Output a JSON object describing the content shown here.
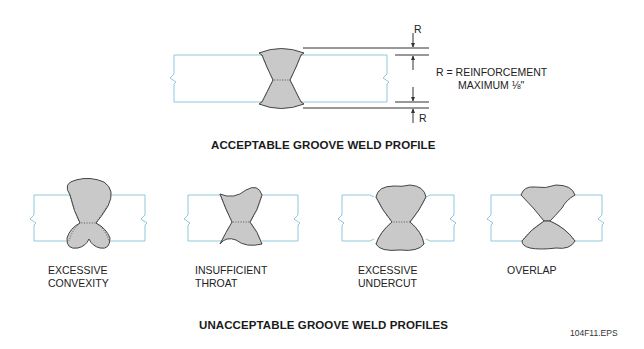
{
  "acceptable": {
    "heading": "ACCEPTABLE GROOVE WELD PROFILE",
    "dimension_symbol_top": "R",
    "dimension_symbol_bottom": "R",
    "note_line1": "R = REINFORCEMENT",
    "note_line2": "MAXIMUM ⅛\""
  },
  "unacceptable": {
    "heading": "UNACCEPTABLE GROOVE WELD PROFILES",
    "profiles": [
      {
        "line1": "EXCESSIVE",
        "line2": "CONVEXITY"
      },
      {
        "line1": "INSUFFICIENT",
        "line2": "THROAT"
      },
      {
        "line1": "EXCESSIVE",
        "line2": "UNDERCUT"
      },
      {
        "line1": "OVERLAP",
        "line2": ""
      }
    ]
  },
  "figure_id": "104F11.EPS",
  "colors": {
    "plate_outline": "#8fc8dc",
    "weld_fill": "#c9c9c9",
    "weld_outline": "#444444"
  }
}
